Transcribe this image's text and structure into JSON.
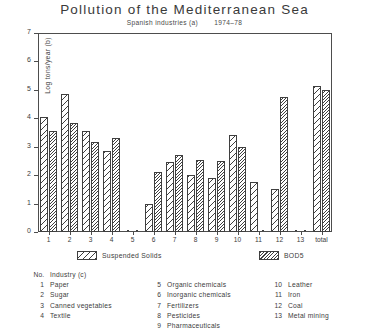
{
  "chart_data": {
    "type": "bar",
    "title": "Pollution of the Mediterranean Sea",
    "subtitle_left": "Spanish industries (a)",
    "subtitle_right": "1974–78",
    "xlabel": "",
    "ylabel": "Log tons/year (b)",
    "ylim": [
      0,
      7
    ],
    "ytick_labels": [
      "0",
      "1",
      "2",
      "3",
      "4",
      "5",
      "6",
      "7"
    ],
    "ytick_values": [
      0,
      1,
      2,
      3,
      4,
      5,
      6,
      7
    ],
    "grid": false,
    "legend_position": "below-axes",
    "categories": [
      "1",
      "2",
      "3",
      "4",
      "5",
      "6",
      "7",
      "8",
      "9",
      "10",
      "11",
      "12",
      "13",
      "total"
    ],
    "series": [
      {
        "name": "Suspended Solids",
        "values": [
          4.05,
          4.85,
          3.55,
          2.85,
          0.05,
          1.0,
          2.45,
          2.0,
          1.9,
          3.4,
          1.75,
          1.5,
          0.05,
          5.15
        ]
      },
      {
        "name": "BOD5",
        "values": [
          3.55,
          3.85,
          3.15,
          3.3,
          0.05,
          2.1,
          2.7,
          2.55,
          2.5,
          3.0,
          0.05,
          4.75,
          0.05,
          5.0
        ]
      }
    ]
  },
  "legend": {
    "suspended_solids": "Suspended Solids",
    "bod5": "BOD5"
  },
  "industry_key": {
    "header_no": "No.",
    "header_industry": "Industry (c)",
    "columns": [
      [
        {
          "no": "1",
          "name": "Paper"
        },
        {
          "no": "2",
          "name": "Sugar"
        },
        {
          "no": "3",
          "name": "Canned  vegetables"
        },
        {
          "no": "4",
          "name": "Textile"
        }
      ],
      [
        {
          "no": "5",
          "name": "Organic  chemicals"
        },
        {
          "no": "6",
          "name": "Inorganic  chemicals"
        },
        {
          "no": "7",
          "name": "Fertilizers"
        },
        {
          "no": "8",
          "name": "Pesticides"
        },
        {
          "no": "9",
          "name": "Pharmaceuticals"
        }
      ],
      [
        {
          "no": "10",
          "name": "Leather"
        },
        {
          "no": "11",
          "name": "Iron"
        },
        {
          "no": "12",
          "name": "Coal"
        },
        {
          "no": "13",
          "name": "Metal  mining"
        }
      ]
    ]
  },
  "colors": {
    "ink": "#3f3f3f",
    "background": "#ffffff"
  }
}
